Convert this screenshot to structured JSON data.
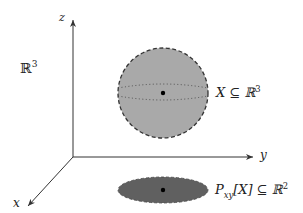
{
  "labels": {
    "space": "ℝ",
    "space_sup": "3",
    "axis_z": "z",
    "axis_y": "y",
    "axis_x": "x",
    "sphere_label_main": "X ⊆ ℝ",
    "sphere_label_sup": "3",
    "proj_P": "P",
    "proj_sub": "xy",
    "proj_rest": "[X] ⊆ ℝ",
    "proj_sup": "2"
  },
  "colors": {
    "axis": "#333333",
    "sphere_fill": "#a9a9a9",
    "sphere_edge": "#333333",
    "ellipse_fill": "#606060",
    "point": "#000000"
  },
  "geometry": {
    "origin": [
      73,
      157
    ],
    "z_tip": [
      73,
      20
    ],
    "y_tip": [
      253,
      157
    ],
    "x_tip": [
      28,
      206
    ],
    "sphere": {
      "cx": 163,
      "cy": 93,
      "r": 45
    },
    "ellipse": {
      "cx": 163,
      "cy": 190,
      "rx": 45,
      "ry": 13
    }
  }
}
